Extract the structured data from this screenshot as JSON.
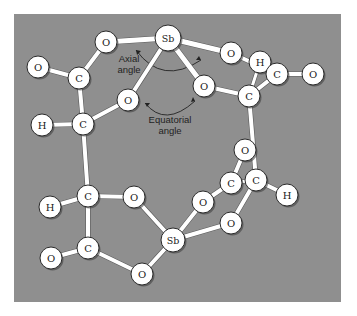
{
  "figure": {
    "background_color": "#8f8f8f",
    "frame": {
      "x": 14,
      "y": 14,
      "width": 327,
      "height": 288
    }
  },
  "annotations": {
    "axial": {
      "line1": "Axial",
      "line2": "angle"
    },
    "equatorial": {
      "line1": "Equatorial",
      "line2": "angle"
    }
  },
  "atoms": [
    {
      "id": "sb1",
      "label": "Sb",
      "x": 168,
      "y": 38,
      "r": 13
    },
    {
      "id": "o1",
      "label": "O",
      "x": 106,
      "y": 42,
      "r": 11
    },
    {
      "id": "o2",
      "label": "O",
      "x": 38,
      "y": 67,
      "r": 11
    },
    {
      "id": "c1",
      "label": "C",
      "x": 79,
      "y": 78,
      "r": 11
    },
    {
      "id": "o3",
      "label": "O",
      "x": 128,
      "y": 100,
      "r": 11
    },
    {
      "id": "c2",
      "label": "C",
      "x": 83,
      "y": 124,
      "r": 11
    },
    {
      "id": "h1",
      "label": "H",
      "x": 42,
      "y": 125,
      "r": 11
    },
    {
      "id": "o4",
      "label": "O",
      "x": 231,
      "y": 53,
      "r": 11
    },
    {
      "id": "h2",
      "label": "H",
      "x": 260,
      "y": 62,
      "r": 11
    },
    {
      "id": "c3",
      "label": "C",
      "x": 277,
      "y": 74,
      "r": 11
    },
    {
      "id": "o5",
      "label": "O",
      "x": 313,
      "y": 74,
      "r": 11
    },
    {
      "id": "o6",
      "label": "O",
      "x": 204,
      "y": 86,
      "r": 11
    },
    {
      "id": "c4",
      "label": "C",
      "x": 249,
      "y": 96,
      "r": 11
    },
    {
      "id": "o7",
      "label": "O",
      "x": 245,
      "y": 150,
      "r": 11
    },
    {
      "id": "c5",
      "label": "C",
      "x": 231,
      "y": 183,
      "r": 11
    },
    {
      "id": "c6",
      "label": "C",
      "x": 256,
      "y": 180,
      "r": 11
    },
    {
      "id": "h3",
      "label": "H",
      "x": 287,
      "y": 195,
      "r": 11
    },
    {
      "id": "o8",
      "label": "O",
      "x": 203,
      "y": 202,
      "r": 11
    },
    {
      "id": "o9",
      "label": "O",
      "x": 231,
      "y": 223,
      "r": 11
    },
    {
      "id": "sb2",
      "label": "Sb",
      "x": 173,
      "y": 240,
      "r": 12
    },
    {
      "id": "c7",
      "label": "C",
      "x": 88,
      "y": 196,
      "r": 11
    },
    {
      "id": "h4",
      "label": "H",
      "x": 50,
      "y": 207,
      "r": 11
    },
    {
      "id": "o10",
      "label": "O",
      "x": 134,
      "y": 197,
      "r": 11
    },
    {
      "id": "c8",
      "label": "C",
      "x": 88,
      "y": 248,
      "r": 11
    },
    {
      "id": "o11",
      "label": "O",
      "x": 51,
      "y": 258,
      "r": 11
    },
    {
      "id": "o12",
      "label": "O",
      "x": 142,
      "y": 274,
      "r": 11
    }
  ],
  "bonds": [
    [
      "o1",
      "sb1",
      5
    ],
    [
      "sb1",
      "o4",
      5
    ],
    [
      "sb1",
      "o3",
      4
    ],
    [
      "sb1",
      "o6",
      5
    ],
    [
      "o1",
      "c1",
      4
    ],
    [
      "o2",
      "c1",
      4
    ],
    [
      "c1",
      "c2",
      4
    ],
    [
      "h1",
      "c2",
      4
    ],
    [
      "c2",
      "o3",
      4
    ],
    [
      "c2",
      "c7",
      4
    ],
    [
      "o4",
      "c3",
      4
    ],
    [
      "c3",
      "o5",
      4
    ],
    [
      "c3",
      "c4",
      4
    ],
    [
      "h2",
      "c4",
      3
    ],
    [
      "o6",
      "c4",
      4
    ],
    [
      "c4",
      "c6",
      4
    ],
    [
      "o7",
      "c5",
      4
    ],
    [
      "c5",
      "c6",
      3
    ],
    [
      "c6",
      "h3",
      4
    ],
    [
      "c5",
      "o8",
      4
    ],
    [
      "c6",
      "o9",
      4
    ],
    [
      "o8",
      "sb2",
      4
    ],
    [
      "o9",
      "sb2",
      4
    ],
    [
      "c7",
      "h4",
      4
    ],
    [
      "c7",
      "o10",
      4
    ],
    [
      "o10",
      "sb2",
      4
    ],
    [
      "c7",
      "c8",
      4
    ],
    [
      "c8",
      "o11",
      4
    ],
    [
      "c8",
      "o12",
      4
    ],
    [
      "o12",
      "sb2",
      4
    ]
  ]
}
